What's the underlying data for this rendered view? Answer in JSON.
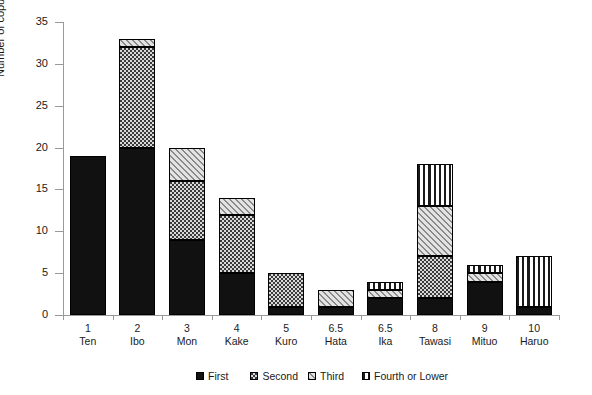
{
  "chart_data": {
    "type": "bar",
    "stacked": true,
    "title": "",
    "xlabel": "",
    "ylabel": "Number of copulations",
    "ylim": [
      0,
      35
    ],
    "yticks": [
      0,
      5,
      10,
      15,
      20,
      25,
      30,
      35
    ],
    "grid": false,
    "legend_position": "bottom",
    "categories": [
      "Ten",
      "Ibo",
      "Mon",
      "Kake",
      "Kuro",
      "Hata",
      "Ika",
      "Tawasi",
      "Mituo",
      "Haruo"
    ],
    "rank_labels": [
      "1",
      "2",
      "3",
      "4",
      "5",
      "6.5",
      "6.5",
      "8",
      "9",
      "10"
    ],
    "series": [
      {
        "name": "First",
        "values": [
          19,
          20,
          9,
          5,
          1,
          1,
          2,
          2,
          4,
          1
        ]
      },
      {
        "name": "Second",
        "values": [
          0,
          12,
          7,
          7,
          4,
          0,
          0,
          5,
          0,
          0
        ]
      },
      {
        "name": "Third",
        "values": [
          0,
          1,
          4,
          2,
          0,
          2,
          1,
          6,
          1,
          0
        ]
      },
      {
        "name": "Fourth or Lower",
        "values": [
          0,
          0,
          0,
          0,
          0,
          0,
          1,
          5,
          1,
          6
        ]
      }
    ],
    "totals": [
      19,
      33,
      20,
      14,
      5,
      3,
      4,
      18,
      6,
      7
    ]
  },
  "axis": {
    "y_label": "Number of copulations",
    "y_ticks": [
      "0",
      "5",
      "10",
      "15",
      "20",
      "25",
      "30",
      "35"
    ]
  },
  "xaxis": {
    "items": [
      {
        "rank": "1",
        "name": "Ten"
      },
      {
        "rank": "2",
        "name": "Ibo"
      },
      {
        "rank": "3",
        "name": "Mon"
      },
      {
        "rank": "4",
        "name": "Kake"
      },
      {
        "rank": "5",
        "name": "Kuro"
      },
      {
        "rank": "6.5",
        "name": "Hata"
      },
      {
        "rank": "6.5",
        "name": "Ika"
      },
      {
        "rank": "8",
        "name": "Tawasi"
      },
      {
        "rank": "9",
        "name": "Mituo"
      },
      {
        "rank": "10",
        "name": "Haruo"
      }
    ]
  },
  "legend": {
    "items": [
      {
        "label": "First",
        "pattern": "solid-black"
      },
      {
        "label": "Second",
        "pattern": "dark-checker"
      },
      {
        "label": "Third",
        "pattern": "light-diagonal-hatch"
      },
      {
        "label": "Fourth or Lower",
        "pattern": "vertical-stripes"
      }
    ]
  },
  "colors": {
    "axis": "#9a9a9a",
    "text": "#1a1a1a",
    "first": "#111111",
    "second": "#3a3a3a",
    "third": "#e3e3e3",
    "fourth": "#f2f2f2",
    "background": "#ffffff"
  }
}
